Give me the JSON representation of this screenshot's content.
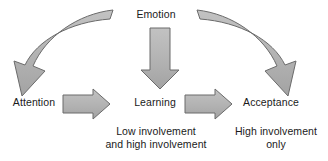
{
  "diagram": {
    "colors": {
      "arrow_fill": "#b3b3b3",
      "arrow_stroke": "#6b6b6b",
      "text": "#1a1a1a",
      "background": "#ffffff"
    },
    "nodes": [
      {
        "id": "emotion",
        "label": "Emotion"
      },
      {
        "id": "attention",
        "label": "Attention"
      },
      {
        "id": "learning",
        "label": "Learning"
      },
      {
        "id": "acceptance",
        "label": "Acceptance"
      }
    ],
    "notes": [
      {
        "id": "low-involvement",
        "label": "Low involvement\nand high involvement"
      },
      {
        "id": "high-involvement",
        "label": "High involvement\nonly"
      }
    ],
    "arrows": [
      {
        "id": "emotion-to-attention",
        "shape": "curved-left",
        "from": "emotion",
        "to": "attention"
      },
      {
        "id": "emotion-to-learning",
        "shape": "straight-down",
        "from": "emotion",
        "to": "learning"
      },
      {
        "id": "emotion-to-acceptance",
        "shape": "curved-right",
        "from": "emotion",
        "to": "acceptance"
      },
      {
        "id": "attention-to-learning",
        "shape": "straight-right",
        "from": "attention",
        "to": "learning"
      },
      {
        "id": "learning-to-acceptance",
        "shape": "straight-right",
        "from": "learning",
        "to": "acceptance"
      }
    ]
  }
}
